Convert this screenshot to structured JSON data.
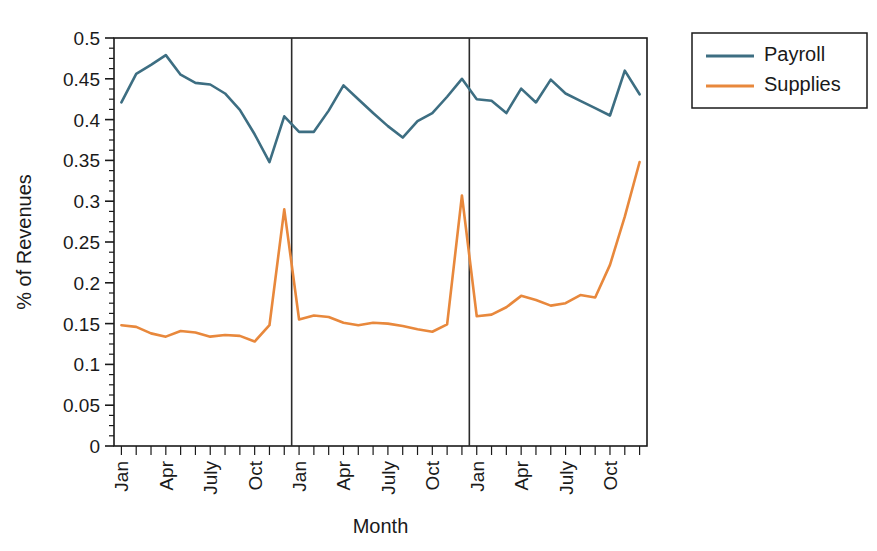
{
  "chart_data": {
    "type": "line",
    "title": "",
    "xlabel": "Month",
    "ylabel": "% of Revenues",
    "ylim": [
      0,
      0.5
    ],
    "ytick_labels": [
      "0",
      "0.05",
      "0.1",
      "0.15",
      "0.2",
      "0.25",
      "0.3",
      "0.35",
      "0.4",
      "0.45",
      "0.5"
    ],
    "ytick_values": [
      0,
      0.05,
      0.1,
      0.15,
      0.2,
      0.25,
      0.3,
      0.35,
      0.4,
      0.45,
      0.5
    ],
    "yminor_step": 0.0125,
    "grid": false,
    "legend_position": "outside top-right",
    "x_total_points": 36,
    "xtick_labels": [
      "Jan",
      "",
      "",
      "Apr",
      "",
      "",
      "July",
      "",
      "",
      "Oct",
      "",
      "",
      "Jan",
      "",
      "",
      "Apr",
      "",
      "",
      "July",
      "",
      "",
      "Oct",
      "",
      "",
      "Jan",
      "",
      "",
      "Apr",
      "",
      "",
      "July",
      "",
      "",
      "Oct",
      "",
      ""
    ],
    "year_divider_indices": [
      12,
      24
    ],
    "series": [
      {
        "name": "Payroll",
        "color": "#3d6e82",
        "values": [
          0.421,
          0.456,
          0.467,
          0.479,
          0.455,
          0.445,
          0.443,
          0.432,
          0.412,
          0.382,
          0.348,
          0.404,
          0.385,
          0.385,
          0.411,
          0.442,
          0.425,
          0.408,
          0.392,
          0.378,
          0.398,
          0.408,
          0.428,
          0.45,
          0.425,
          0.423,
          0.408,
          0.438,
          0.421,
          0.449,
          0.432,
          0.423,
          0.414,
          0.405,
          0.46,
          0.431
        ]
      },
      {
        "name": "Supplies",
        "color": "#e8883c",
        "values": [
          0.148,
          0.146,
          0.138,
          0.134,
          0.141,
          0.139,
          0.134,
          0.136,
          0.135,
          0.128,
          0.148,
          0.29,
          0.155,
          0.16,
          0.158,
          0.151,
          0.148,
          0.151,
          0.15,
          0.147,
          0.143,
          0.14,
          0.149,
          0.307,
          0.159,
          0.161,
          0.17,
          0.184,
          0.179,
          0.172,
          0.175,
          0.185,
          0.182,
          0.222,
          0.281,
          0.348
        ]
      }
    ]
  },
  "legend": {
    "entries": [
      {
        "label": "Payroll",
        "color": "#3d6e82"
      },
      {
        "label": "Supplies",
        "color": "#e8883c"
      }
    ]
  },
  "axes": {
    "x_label": "Month",
    "y_label": "% of Revenues"
  }
}
